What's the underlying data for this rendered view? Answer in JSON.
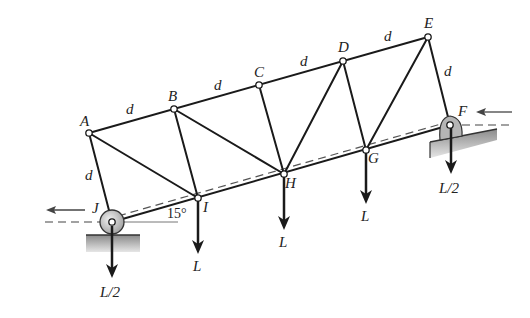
{
  "diagram": {
    "type": "truss",
    "incline_angle": "15°",
    "nodes": {
      "A": {
        "label": "A",
        "x": 89,
        "y": 133
      },
      "B": {
        "label": "B",
        "x": 174,
        "y": 109
      },
      "C": {
        "label": "C",
        "x": 259,
        "y": 85
      },
      "D": {
        "label": "D",
        "x": 343,
        "y": 61
      },
      "E": {
        "label": "E",
        "x": 428,
        "y": 37
      },
      "F": {
        "label": "F",
        "x": 450,
        "y": 125
      },
      "G": {
        "label": "G",
        "x": 366,
        "y": 150
      },
      "H": {
        "label": "H",
        "x": 284,
        "y": 174
      },
      "I": {
        "label": "I",
        "x": 198,
        "y": 198
      },
      "J": {
        "label": "J",
        "x": 112,
        "y": 222
      }
    },
    "member_labels": [
      "d",
      "d",
      "d",
      "d",
      "d",
      "d"
    ],
    "loads": {
      "I": "L",
      "H": "L",
      "G": "L",
      "J": "L/2",
      "F": "L/2"
    },
    "supports": {
      "J": "roller",
      "F": "pin"
    }
  }
}
